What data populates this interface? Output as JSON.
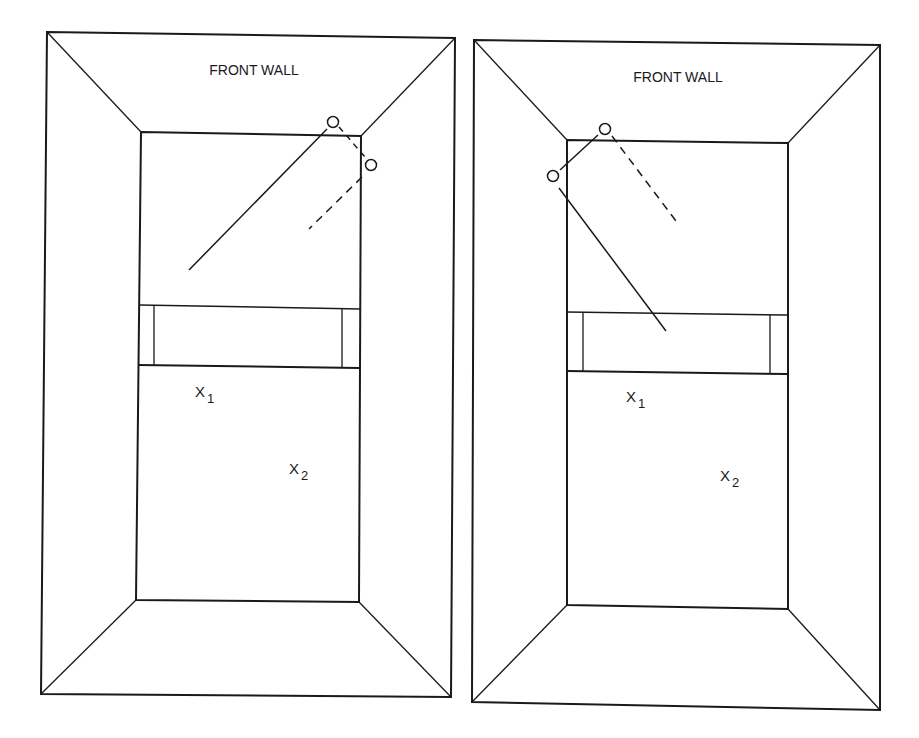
{
  "figure": {
    "colors": {
      "ink": "#1a1a1a",
      "background": "#ffffff"
    },
    "panels": [
      {
        "id": "left",
        "front_wall_label": "FRONT WALL",
        "positions": [
          {
            "label": "X",
            "sub": "1"
          },
          {
            "label": "X",
            "sub": "2"
          }
        ],
        "ball_path": "solid line from lower-left to front wall near right corner, bounce to right side wall, dashed rebound toward center",
        "bounce_points": 2
      },
      {
        "id": "right",
        "front_wall_label": "FRONT WALL",
        "positions": [
          {
            "label": "X",
            "sub": "1"
          },
          {
            "label": "X",
            "sub": "2"
          }
        ],
        "ball_path": "solid line from service zone up to left side wall near front corner, bounce to front wall, dashed rebound toward center",
        "bounce_points": 2
      }
    ]
  }
}
